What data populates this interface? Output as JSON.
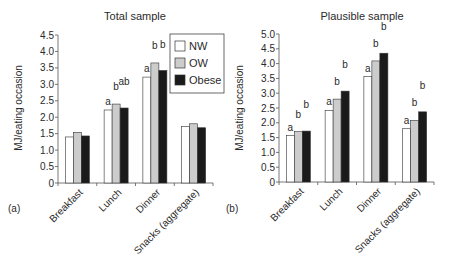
{
  "chart_data": [
    {
      "type": "bar",
      "panel_label": "(a)",
      "title": "Total sample",
      "xlabel": "",
      "ylabel": "MJ/eating occasion",
      "ylim": [
        0,
        4.5
      ],
      "yticks": [
        "0",
        "0.5",
        "1.0",
        "1.5",
        "2.0",
        "2.5",
        "3.0",
        "3.5",
        "4.0",
        "4.5"
      ],
      "grid": false,
      "legend_position": "upper right",
      "categories": [
        "Breakfast",
        "Lunch",
        "Dinner",
        "Snacks (aggregate)"
      ],
      "series": [
        {
          "name": "NW",
          "color": "#ffffff",
          "values": [
            1.4,
            2.22,
            3.22,
            1.72
          ],
          "annotations": [
            "",
            "a",
            "a",
            ""
          ]
        },
        {
          "name": "OW",
          "color": "#cccccc",
          "values": [
            1.54,
            2.4,
            3.65,
            1.8
          ],
          "annotations": [
            "",
            "b",
            "b",
            ""
          ]
        },
        {
          "name": "Obese",
          "color": "#1a1a1a",
          "values": [
            1.43,
            2.28,
            3.42,
            1.68
          ],
          "annotations": [
            "",
            "ab",
            "b",
            ""
          ]
        }
      ]
    },
    {
      "type": "bar",
      "panel_label": "(b)",
      "title": "Plausible sample",
      "xlabel": "",
      "ylabel": "MJ/eating occasion",
      "ylim": [
        0,
        5.0
      ],
      "yticks": [
        "0",
        "0.5",
        "1.0",
        "1.5",
        "2.0",
        "2.5",
        "3.0",
        "3.5",
        "4.0",
        "4.5",
        "5.0"
      ],
      "grid": false,
      "legend_position": "none",
      "categories": [
        "Breakfast",
        "Lunch",
        "Dinner",
        "Snacks (aggregate)"
      ],
      "series": [
        {
          "name": "NW",
          "color": "#ffffff",
          "values": [
            1.57,
            2.42,
            3.56,
            1.8
          ],
          "annotations": [
            "a",
            "a",
            "a",
            "a"
          ]
        },
        {
          "name": "OW",
          "color": "#cccccc",
          "values": [
            1.7,
            2.8,
            4.09,
            2.08
          ],
          "annotations": [
            "b",
            "b",
            "b",
            "b"
          ]
        },
        {
          "name": "Obese",
          "color": "#1a1a1a",
          "values": [
            1.72,
            3.07,
            4.35,
            2.37
          ],
          "annotations": [
            "b",
            "b",
            "b",
            "b"
          ]
        }
      ]
    }
  ],
  "legend": {
    "items": [
      {
        "label": "NW",
        "color": "#ffffff"
      },
      {
        "label": "OW",
        "color": "#cccccc"
      },
      {
        "label": "Obese",
        "color": "#1a1a1a"
      }
    ]
  }
}
